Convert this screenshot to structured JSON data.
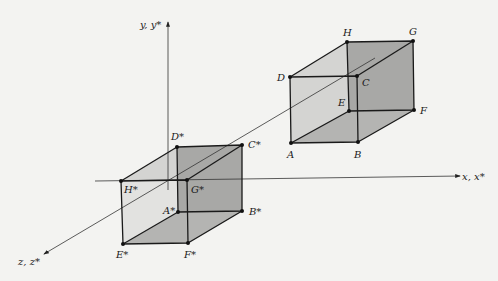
{
  "figure": {
    "axes": {
      "y_label": "y, y*",
      "x_label": "x, x*",
      "z_label": "z, z*"
    },
    "original_cube": {
      "vertices": {
        "A": "A",
        "B": "B",
        "C": "C",
        "D": "D",
        "E": "E",
        "F": "F",
        "G": "G",
        "H": "H"
      }
    },
    "reflected_cube": {
      "vertices": {
        "A": "A*",
        "B": "B*",
        "C": "C*",
        "D": "D*",
        "E": "E*",
        "F": "F*",
        "G": "G*",
        "H": "H*"
      }
    }
  }
}
